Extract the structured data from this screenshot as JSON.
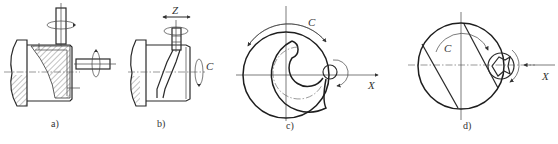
{
  "figure": {
    "subfigures": [
      {
        "id": "a",
        "caption": "a)",
        "description": "Workpiece with hatched section, vertical rotating cutter and horizontal rotating cutter"
      },
      {
        "id": "b",
        "caption": "b)",
        "description": "Workpiece with helical slot, vertical cutter moving along Z, rotation C",
        "labels": {
          "z": "Z",
          "c": "C"
        }
      },
      {
        "id": "c",
        "caption": "c)",
        "description": "Spiral groove on circular workpiece, rotation C, cutter along X",
        "labels": {
          "c": "C",
          "x": "X"
        }
      },
      {
        "id": "d",
        "caption": "d)",
        "description": "Circular workpiece with parallel chords, end mill along X, rotation C",
        "labels": {
          "c": "C",
          "x": "X"
        }
      }
    ]
  },
  "colors": {
    "line": "#2a2a2a",
    "background": "#ffffff"
  }
}
